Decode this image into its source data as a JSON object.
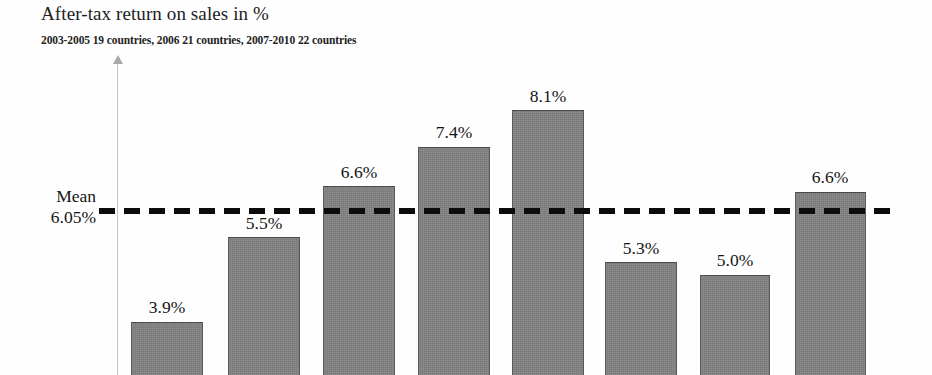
{
  "chart_data": {
    "type": "bar",
    "title": "After-tax return on sales in %",
    "subtitle": "2003-2005 19 countries, 2006 21 countries, 2007-2010 22 countries",
    "xlabel": "",
    "ylabel": "",
    "grid": false,
    "legend": "none",
    "ylim": [
      0,
      9
    ],
    "categories": [
      "1",
      "2",
      "3",
      "4",
      "5",
      "6",
      "7",
      "8"
    ],
    "values": [
      3.9,
      5.5,
      6.6,
      7.4,
      8.1,
      5.3,
      5.0,
      6.6
    ],
    "value_labels": [
      "3.9%",
      "5.5%",
      "6.6%",
      "7.4%",
      "8.1%",
      "5.3%",
      "5.0%",
      "6.6%"
    ],
    "bar_color": "#828282",
    "bar_edge_color": "#4b4b4b",
    "annotations": [
      {
        "type": "mean-line",
        "label_line1": "Mean",
        "label_line2": "6.05%",
        "value": 6.05,
        "style": "dashed",
        "color": "#0c0c0c"
      }
    ]
  },
  "header": {
    "title": "After-tax return on sales in %",
    "subtitle": "2003-2005 19 countries, 2006 21 countries, 2007-2010 22 countries"
  },
  "mean": {
    "label": "Mean",
    "value_label": "6.05%"
  },
  "bars": [
    {
      "label": "3.9%"
    },
    {
      "label": "5.5%"
    },
    {
      "label": "6.6%"
    },
    {
      "label": "7.4%"
    },
    {
      "label": "8.1%"
    },
    {
      "label": "5.3%"
    },
    {
      "label": "5.0%"
    },
    {
      "label": "6.6%"
    }
  ],
  "geometry": {
    "bars": [
      {
        "x": 131,
        "w": 72,
        "top": 322
      },
      {
        "x": 228,
        "w": 72,
        "top": 237
      },
      {
        "x": 323,
        "w": 72,
        "top": 186
      },
      {
        "x": 418,
        "w": 72,
        "top": 147
      },
      {
        "x": 512,
        "w": 72,
        "top": 110
      },
      {
        "x": 605,
        "w": 72,
        "top": 262
      },
      {
        "x": 700,
        "w": 70,
        "top": 275
      },
      {
        "x": 795,
        "w": 71,
        "top": 192
      }
    ],
    "labels": [
      {
        "cx": 167,
        "top": 297
      },
      {
        "cx": 264,
        "top": 213
      },
      {
        "cx": 359,
        "top": 162
      },
      {
        "cx": 454,
        "top": 122
      },
      {
        "cx": 548,
        "top": 86
      },
      {
        "cx": 641,
        "top": 238
      },
      {
        "cx": 735,
        "top": 250
      },
      {
        "cx": 830,
        "top": 167
      }
    ],
    "bottom": 375
  }
}
